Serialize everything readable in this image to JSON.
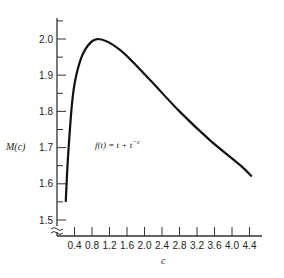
{
  "chart_data": {
    "type": "line",
    "title": "",
    "xlabel": "c",
    "ylabel": "M(c)",
    "annotation": {
      "base": "f(t) = t + t",
      "superscript": "−c"
    },
    "x_ticks": [
      "0.4",
      "0.8",
      "1.2",
      "1.6",
      "2.0",
      "2.4",
      "2.8",
      "3.2",
      "3.6",
      "4.0",
      "4.4"
    ],
    "y_ticks": [
      "1.5",
      "1.6",
      "1.7",
      "1.8",
      "1.9",
      "2.0"
    ],
    "xlim": [
      0,
      4.6
    ],
    "ylim": [
      1.5,
      2.05
    ],
    "grid": false,
    "axis_break": true,
    "series": [
      {
        "name": "M(c)",
        "x": [
          0.2,
          0.25,
          0.35,
          0.46,
          0.64,
          0.94,
          1.44,
          2.1,
          2.8,
          3.5,
          4.2,
          4.45
        ],
        "y": [
          1.55,
          1.67,
          1.83,
          1.91,
          1.97,
          2.0,
          1.97,
          1.89,
          1.8,
          1.72,
          1.65,
          1.62
        ]
      }
    ]
  }
}
